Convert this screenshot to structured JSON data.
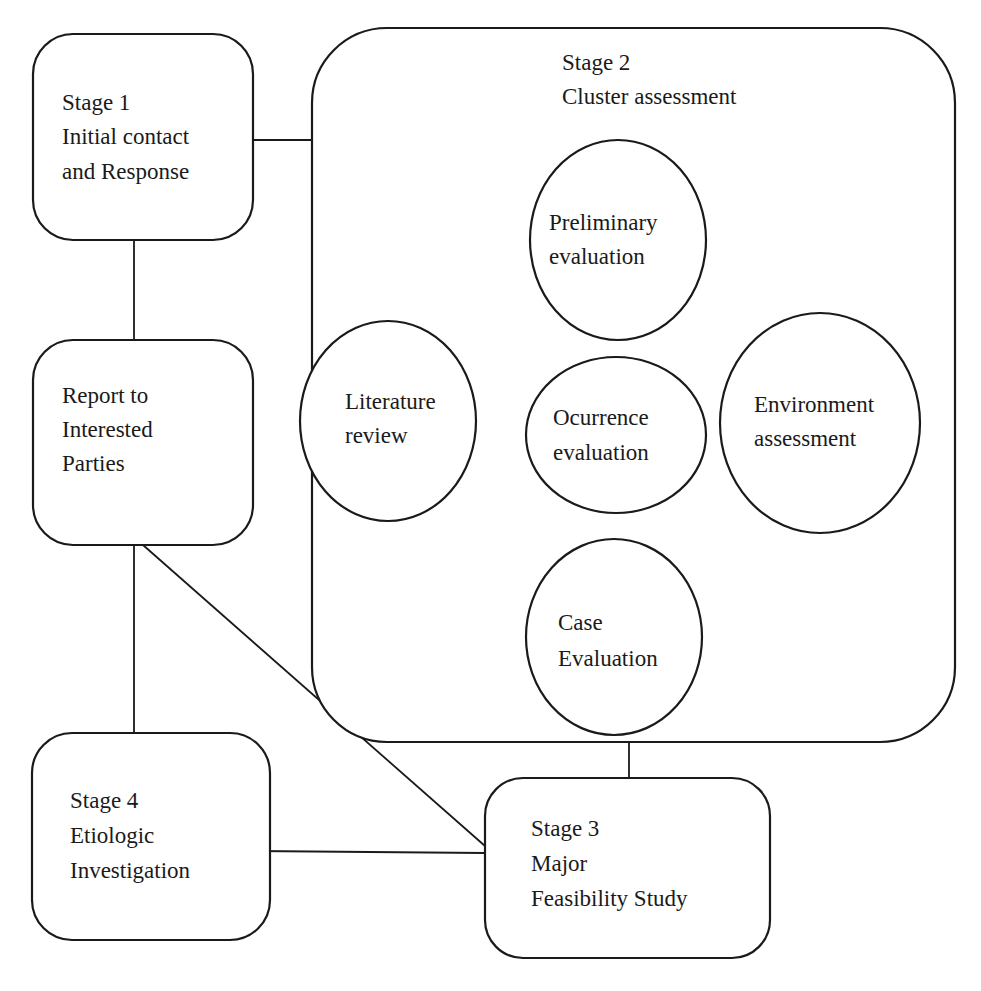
{
  "diagram": {
    "type": "flow",
    "nodes": {
      "stage1": {
        "shape": "rounded-rect",
        "lines": [
          "Stage 1",
          "Initial contact",
          "and Response"
        ]
      },
      "report": {
        "shape": "rounded-rect",
        "lines": [
          "Report to",
          "Interested",
          "Parties"
        ]
      },
      "stage2": {
        "shape": "rounded-rect-container",
        "lines": [
          "Stage 2",
          "Cluster assessment"
        ]
      },
      "preliminary": {
        "shape": "ellipse",
        "parent": "stage2",
        "lines": [
          "Preliminary",
          "evaluation"
        ]
      },
      "literature": {
        "shape": "ellipse",
        "parent": "stage2",
        "lines": [
          "Literature",
          "review"
        ]
      },
      "occurrence": {
        "shape": "ellipse",
        "parent": "stage2",
        "lines": [
          "Ocurrence",
          "evaluation"
        ]
      },
      "environment": {
        "shape": "ellipse",
        "parent": "stage2",
        "lines": [
          "Environment",
          "assessment"
        ]
      },
      "case": {
        "shape": "ellipse",
        "parent": "stage2",
        "lines": [
          "Case",
          "Evaluation"
        ]
      },
      "stage3": {
        "shape": "rounded-rect",
        "lines": [
          "Stage 3",
          "Major",
          "Feasibility Study"
        ]
      },
      "stage4": {
        "shape": "rounded-rect",
        "lines": [
          "Stage 4",
          "Etiologic",
          "Investigation"
        ]
      }
    },
    "edges": [
      {
        "from": "stage1",
        "to": "stage2"
      },
      {
        "from": "stage1",
        "to": "report"
      },
      {
        "from": "preliminary",
        "to": "literature"
      },
      {
        "from": "preliminary",
        "to": "occurrence"
      },
      {
        "from": "preliminary",
        "to": "environment"
      },
      {
        "from": "occurrence",
        "to": "case"
      },
      {
        "from": "report",
        "to": "stage4"
      },
      {
        "from": "report",
        "to": "stage3"
      },
      {
        "from": "stage2",
        "to": "stage3"
      },
      {
        "from": "stage4",
        "to": "stage3"
      }
    ],
    "colors": {
      "stroke": "#1a1a1a",
      "fill": "#ffffff",
      "background": "#ffffff"
    }
  }
}
